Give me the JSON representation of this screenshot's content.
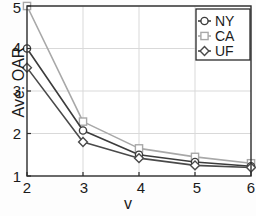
{
  "chart_data": {
    "type": "line",
    "title": "",
    "xlabel": "v",
    "ylabel": "Ave. OAR",
    "x": [
      2,
      3,
      4,
      5,
      6
    ],
    "xlim": [
      2,
      6
    ],
    "ylim": [
      1,
      5
    ],
    "xticks": [
      "2",
      "3",
      "4",
      "5",
      "6"
    ],
    "yticks": [
      "1",
      "2",
      "3",
      "4",
      "5"
    ],
    "grid": true,
    "legend_position": "upper right",
    "series": [
      {
        "name": "NY",
        "marker": "circle",
        "color": "#3c3c3c",
        "values": [
          4.0,
          2.07,
          1.5,
          1.33,
          1.23
        ]
      },
      {
        "name": "CA",
        "marker": "square",
        "color": "#a8a8a8",
        "values": [
          5.0,
          2.28,
          1.65,
          1.45,
          1.3
        ]
      },
      {
        "name": "UF",
        "marker": "diamond",
        "color": "#4a4a4a",
        "values": [
          3.55,
          1.8,
          1.42,
          1.25,
          1.2
        ]
      }
    ]
  },
  "axes": {
    "ylabel": "Ave. OAR",
    "xlabel": "v",
    "yticklabels": [
      "5",
      "4",
      "3",
      "2",
      "1"
    ],
    "xticklabels": [
      "2",
      "3",
      "4",
      "5",
      "6"
    ]
  },
  "legend": {
    "entries": [
      "NY",
      "CA",
      "UF"
    ]
  },
  "colors": {
    "axis": "#2b2b2b",
    "grid": "#d9d9d9",
    "ny": "#3c3c3c",
    "ca": "#a8a8a8",
    "uf": "#4a4a4a",
    "background": "#fdfdfd"
  }
}
